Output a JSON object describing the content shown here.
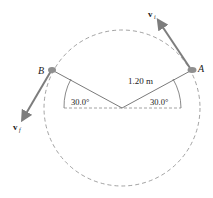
{
  "diagram": {
    "circle": {
      "style": "dashed",
      "color": "#8a8a8a"
    },
    "radius_label": "1.20 m",
    "angle_left_label": "30.0°",
    "angle_right_label": "30.0°",
    "point_a_label": "A",
    "point_b_label": "B",
    "velocity_a": {
      "symbol": "v",
      "subscript": "i"
    },
    "velocity_b": {
      "symbol": "v",
      "subscript": "f"
    },
    "colors": {
      "arrow": "#7d7d7d",
      "line": "#6b6b6b",
      "point": "#8f8f8f",
      "text": "#222222"
    }
  }
}
